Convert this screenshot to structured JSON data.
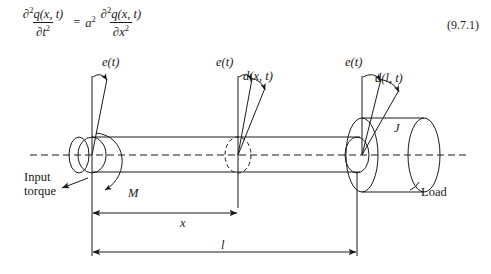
{
  "figure": {
    "equation": {
      "lhs": {
        "numerator_partial": "∂",
        "numerator_sup": "2",
        "numerator_fn": "q(x, t)",
        "denominator_partial": "∂",
        "denominator_var": "t",
        "denominator_sup": "2"
      },
      "equals": "=",
      "coefficient": "a",
      "coefficient_sup": "2",
      "rhs": {
        "numerator_partial": "∂",
        "numerator_sup": "2",
        "numerator_fn": "q(x, t)",
        "denominator_partial": "∂",
        "denominator_var": "x",
        "denominator_sup": "2"
      },
      "number": "(9.7.1)"
    },
    "labels": {
      "e_t_left": "e(t)",
      "e_t_mid": "e(t)",
      "e_t_right": "e(t)",
      "d_x_t": "d(x, t)",
      "d_l_t": "d(l, t)",
      "inertia": "J",
      "torque_moment": "M",
      "dimension_x": "x",
      "dimension_l": "l",
      "input_torque_line1": "Input",
      "input_torque_line2": "torque",
      "load": "Load"
    },
    "colors": {
      "stroke": "#1a1a1a",
      "background": "#ffffff",
      "text": "#1a1a1a"
    },
    "geometry": {
      "shaft_top_y": 137,
      "shaft_bottom_y": 172,
      "centerline_y": 155,
      "centerline_x_start": 30,
      "centerline_x_end": 468,
      "left_end_x": 92,
      "section_x": 238,
      "right_end_x": 357,
      "disk_right_x": 424,
      "dim_x_line_y": 213,
      "dim_l_line_y": 252
    }
  }
}
